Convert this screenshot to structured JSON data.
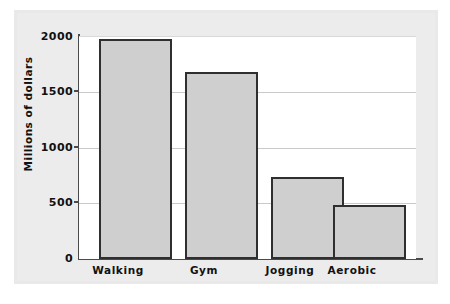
{
  "chart_data": {
    "type": "bar",
    "title": "",
    "subtitle": "",
    "xlabel": "",
    "ylabel": "Millions of dollars",
    "categories": [
      "Walking",
      "Gym",
      "Jogging",
      "Aerobic"
    ],
    "values": [
      1975,
      1680,
      740,
      485
    ],
    "ylim": [
      0,
      2000
    ],
    "yticks": [
      0,
      500,
      1000,
      1500,
      2000
    ],
    "ytick_labels": [
      "0",
      "500",
      "1000",
      "1500",
      "2000"
    ],
    "grid": true,
    "grid_axis": "y",
    "legend": false,
    "legend_position": "none",
    "orientation": "vertical",
    "bar_color": "#cfcfcf",
    "bar_edge_color": "#2f2f2f",
    "plot_background": "#ffffff",
    "figure_background": "#e9e9e9",
    "axis_color": "#4a4a4a",
    "gridline_color": "#c9c9c9",
    "text_color": "#111111"
  }
}
